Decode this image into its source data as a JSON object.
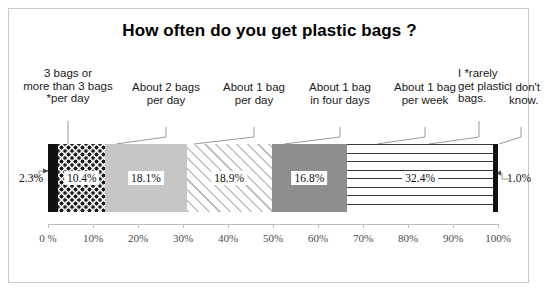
{
  "chart_data": {
    "type": "bar",
    "orientation": "horizontal-stacked",
    "title": "How often do you get plastic bags ?",
    "xlabel": "",
    "ylabel": "",
    "xlim": [
      0,
      100
    ],
    "grid": false,
    "legend": "callout-labels-above-segments",
    "categories": [
      "3 bags or\nmore than 3 bags\n*per day",
      "About 2 bags\nper day",
      "About 1 bag\nper day",
      "About 1 bag\nin four days",
      "About 1 bag\nper week",
      "I *rarely\nget plastic\nbags.",
      "I don't\nknow."
    ],
    "values": [
      2.3,
      10.4,
      18.1,
      18.9,
      16.8,
      32.4,
      1.0
    ],
    "value_labels": [
      "2.3%",
      "10.4%",
      "18.1%",
      "18.9%",
      "16.8%",
      "32.4%",
      "1.0%"
    ],
    "fills": [
      "solid-black",
      "dotted",
      "light-gray",
      "diagonal-hatch",
      "medium-gray",
      "horizontal-lines",
      "solid-black"
    ],
    "label_placement": [
      "outside-left",
      "inside",
      "inside",
      "inside",
      "inside",
      "inside",
      "outside-right"
    ],
    "ticks": [
      "0 %",
      "10%",
      "20%",
      "30%",
      "40%",
      "50%",
      "60%",
      "70%",
      "80%",
      "90%",
      "100%"
    ],
    "tick_values": [
      0,
      10,
      20,
      30,
      40,
      50,
      60,
      70,
      80,
      90,
      100
    ]
  },
  "colors": {
    "frame": "#c9c9c9",
    "axis": "#bdbdbd",
    "text": "#1a1a1a",
    "tick_text": "#4a4a4a",
    "black_fill": "#111111",
    "light_gray_fill": "#c6c6c6",
    "medium_gray_fill": "#8e8e8e"
  }
}
